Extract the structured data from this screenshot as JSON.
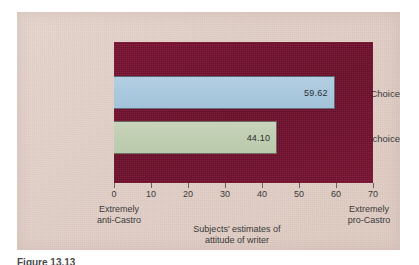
{
  "chart_data": {
    "type": "bar",
    "orientation": "horizontal",
    "categories": [
      "Choice",
      "No choice"
    ],
    "values": [
      59.62,
      44.1
    ],
    "value_labels": [
      "59.62",
      "44.10"
    ],
    "title": "",
    "xlabel": "Subjects' estimates of attitude of writer",
    "ylabel": "",
    "xlim": [
      0,
      70
    ],
    "xticks": [
      0,
      10,
      20,
      30,
      40,
      50,
      60,
      70
    ],
    "xtick_labels": [
      "0",
      "10",
      "20",
      "30",
      "40",
      "50",
      "60",
      "70"
    ],
    "grid": false,
    "legend": false,
    "series": [
      {
        "name": "Choice",
        "value": 59.62,
        "label": "59.62",
        "color": "#a9c8dd"
      },
      {
        "name": "No choice",
        "value": 44.1,
        "label": "44.10",
        "color": "#bfcdb1"
      }
    ],
    "anchors": {
      "left": "Extremely\nanti-Castro",
      "left_line1": "Extremely",
      "left_line2": "anti-Castro",
      "right": "Extremely\npro-Castro",
      "right_line1": "Extremely",
      "right_line2": "pro-Castro"
    },
    "axis_title_line1": "Subjects' estimates of",
    "axis_title_line2": "attitude of writer"
  },
  "colors": {
    "panel_background": "#e0cdc5",
    "plot_background": "#7a1232",
    "bar_choice": "#a9c8dd",
    "bar_no_choice": "#bfcdb1",
    "text": "#3a3a3c"
  },
  "caption": {
    "text": "Figure 13.13"
  }
}
